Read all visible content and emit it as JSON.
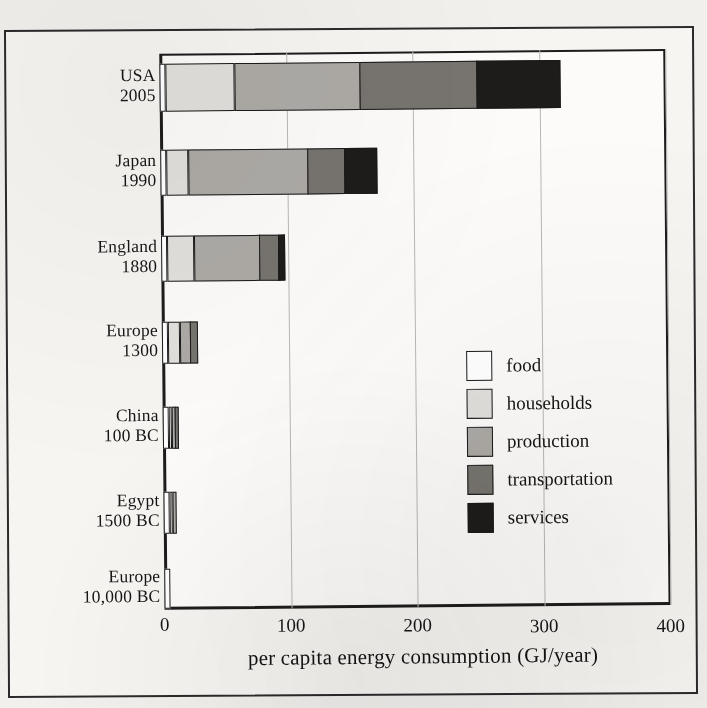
{
  "chart_data": {
    "type": "bar",
    "orientation": "horizontal",
    "stacked": true,
    "title": "",
    "xlabel": "per capita energy consumption (GJ/year)",
    "ylabel": "",
    "xlim": [
      0,
      400
    ],
    "xticks": [
      0,
      100,
      200,
      300,
      400
    ],
    "xtick_labels": [
      "0",
      "100",
      "200",
      "300",
      "400"
    ],
    "grid": true,
    "grid_axis": "x",
    "legend_position": "inside-right",
    "categories": [
      "USA 2005",
      "Japan 1990",
      "England 1880",
      "Europe 1300",
      "China 100 BC",
      "Egypt 1500 BC",
      "Europe 10,000 BC"
    ],
    "category_lines": [
      [
        "USA",
        "2005"
      ],
      [
        "Japan",
        "1990"
      ],
      [
        "England",
        "1880"
      ],
      [
        "Europe",
        "1300"
      ],
      [
        "China",
        "100 BC"
      ],
      [
        "Egypt",
        "1500 BC"
      ],
      [
        "Europe",
        "10,000 BC"
      ]
    ],
    "series": [
      {
        "name": "food",
        "color": "#ffffff",
        "values": [
          5,
          5,
          5,
          5,
          5,
          5,
          5
        ]
      },
      {
        "name": "households",
        "color": "#e2e0dc",
        "values": [
          55,
          18,
          22,
          10,
          3,
          3,
          0
        ]
      },
      {
        "name": "production",
        "color": "#adaaa6",
        "values": [
          100,
          95,
          52,
          9,
          3,
          3,
          0
        ]
      },
      {
        "name": "transportation",
        "color": "#77746f",
        "values": [
          93,
          30,
          16,
          6,
          3,
          0,
          0
        ]
      },
      {
        "name": "services",
        "color": "#1d1c1b",
        "values": [
          66,
          26,
          5,
          0,
          0,
          0,
          0
        ]
      }
    ],
    "totals": [
      319,
      174,
      100,
      30,
      14,
      11,
      5
    ]
  },
  "legend": {
    "items": [
      {
        "label": "food",
        "color": "#ffffff"
      },
      {
        "label": "households",
        "color": "#e2e0dc"
      },
      {
        "label": "production",
        "color": "#adaaa6"
      },
      {
        "label": "transportation",
        "color": "#77746f"
      },
      {
        "label": "services",
        "color": "#1d1c1b"
      }
    ]
  },
  "axis": {
    "x_title": "per capita energy consumption (GJ/year)",
    "ticks": [
      "0",
      "100",
      "200",
      "300",
      "400"
    ]
  }
}
